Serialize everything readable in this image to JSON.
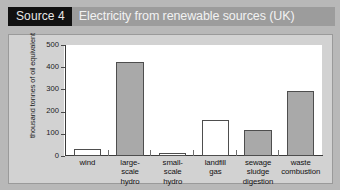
{
  "header": {
    "source_tag": "Source 4",
    "title": "Electricity from renewable sources (UK)"
  },
  "colors": {
    "header_tag_bg": "#111111",
    "header_title_bg": "#9c9c9c",
    "page_bg": "#b8b8b8",
    "chart_bg": "#d2d2d2",
    "plot_bg": "#ffffff",
    "bar_filled": "#a9a9a9",
    "bar_empty": "#ffffff",
    "bar_stroke": "#4e4e4e",
    "axis": "#3b3b3b"
  },
  "chart_data": {
    "type": "bar",
    "title": "Electricity from renewable sources (UK)",
    "xlabel": "",
    "ylabel": "thousand tonnes of oil equivalent",
    "ylim": [
      0,
      500
    ],
    "yticks": [
      500,
      400,
      300,
      200,
      100,
      0
    ],
    "ytick_labels": [
      "500",
      "400",
      "300",
      "200",
      "100",
      "0"
    ],
    "grid": false,
    "legend": "none",
    "categories": [
      "wind",
      "large-scale hydro",
      "small-scale hydro",
      "landfill gas",
      "sewage sludge digestion",
      "waste combustion"
    ],
    "category_lines": [
      [
        "wind"
      ],
      [
        "large-",
        "scale",
        "hydro"
      ],
      [
        "small-",
        "scale",
        "hydro"
      ],
      [
        "landfill",
        "gas"
      ],
      [
        "sewage",
        "sludge",
        "digestion"
      ],
      [
        "waste",
        "combustion"
      ]
    ],
    "values": [
      30,
      423,
      12,
      163,
      116,
      295
    ],
    "bar_fills": [
      "empty",
      "filled",
      "empty",
      "empty",
      "filled",
      "filled"
    ]
  }
}
